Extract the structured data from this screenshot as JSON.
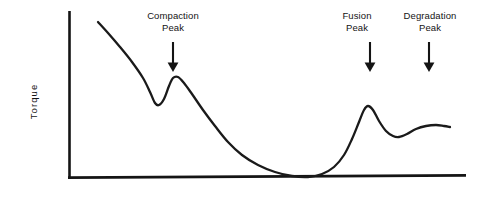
{
  "figure": {
    "title": "",
    "axis": {
      "ylabel": "Torque",
      "xlabel": "",
      "origin": [
        68,
        179
      ],
      "y_axis_top": [
        68,
        11
      ],
      "x_axis_right": [
        466,
        179
      ]
    },
    "annotations": [
      {
        "name": "compaction-peak",
        "line1": "Compaction",
        "line2": "Peak",
        "arrow_x": 173,
        "arrow_top": 42,
        "arrow_bottom": 72
      },
      {
        "name": "fusion-peak",
        "line1": "Fusion",
        "line2": "Peak",
        "arrow_x": 370,
        "arrow_top": 42,
        "arrow_bottom": 72
      },
      {
        "name": "degradation-peak",
        "line1": "Degradation",
        "line2": "Peak",
        "arrow_x": 429,
        "arrow_top": 42,
        "arrow_bottom": 72
      }
    ],
    "colors": {
      "background": "#ffffff",
      "ink": "#141414",
      "curve": "#1a1a1a"
    }
  },
  "chart_data": {
    "type": "line",
    "title": "",
    "xlabel": "",
    "ylabel": "Torque",
    "grid": false,
    "legend": null,
    "xlim": [
      68,
      466
    ],
    "ylim": [
      179,
      11
    ],
    "axis_note": "Unlabeled axes; torque (vertical) versus time (horizontal). Values are pixel coordinates read off the plotted trace.",
    "series": [
      {
        "name": "torque-trace",
        "description": "Torque rheometer fusion curve showing compaction peak, minimum, fusion peak and degradation peak.",
        "points": [
          [
            98,
            22
          ],
          [
            108,
            33
          ],
          [
            120,
            47
          ],
          [
            132,
            62
          ],
          [
            143,
            78
          ],
          [
            150,
            92
          ],
          [
            155,
            103
          ],
          [
            159,
            105
          ],
          [
            164,
            99
          ],
          [
            169,
            86
          ],
          [
            173,
            78
          ],
          [
            178,
            77
          ],
          [
            184,
            83
          ],
          [
            192,
            94
          ],
          [
            203,
            110
          ],
          [
            215,
            126
          ],
          [
            228,
            142
          ],
          [
            242,
            155
          ],
          [
            258,
            165
          ],
          [
            275,
            172
          ],
          [
            292,
            176
          ],
          [
            308,
            177
          ],
          [
            322,
            174
          ],
          [
            334,
            167
          ],
          [
            344,
            155
          ],
          [
            352,
            139
          ],
          [
            359,
            122
          ],
          [
            364,
            110
          ],
          [
            368,
            106
          ],
          [
            373,
            110
          ],
          [
            379,
            121
          ],
          [
            386,
            131
          ],
          [
            393,
            136
          ],
          [
            399,
            137
          ],
          [
            407,
            134
          ],
          [
            416,
            129
          ],
          [
            426,
            126
          ],
          [
            436,
            125
          ],
          [
            444,
            126
          ],
          [
            450,
            127
          ]
        ]
      }
    ],
    "features": [
      {
        "label": "Compaction Peak",
        "x": 173,
        "y": 78,
        "kind": "local-maximum"
      },
      {
        "label": "Minimum",
        "x": 310,
        "y": 177,
        "kind": "global-minimum"
      },
      {
        "label": "Fusion Peak",
        "x": 368,
        "y": 106,
        "kind": "local-maximum"
      },
      {
        "label": "Degradation Peak",
        "x": 432,
        "y": 125,
        "kind": "local-maximum"
      }
    ]
  }
}
